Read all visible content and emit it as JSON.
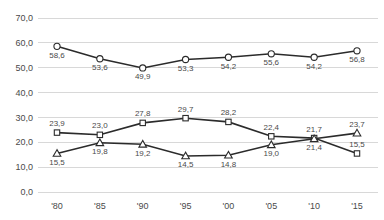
{
  "chart_data": {
    "type": "line",
    "title": "",
    "xlabel": "",
    "ylabel": "",
    "categories": [
      "'80",
      "'85",
      "'90",
      "'95",
      "'00",
      "'05",
      "'10",
      "'15"
    ],
    "ylim": [
      0,
      70
    ],
    "ytick_values": [
      0,
      10,
      20,
      30,
      40,
      50,
      60,
      70
    ],
    "ytick_labels": [
      "0,0",
      "10,0",
      "20,0",
      "30,0",
      "40,0",
      "50,0",
      "60,0",
      "70,0"
    ],
    "grid": true,
    "decimal_separator": ",",
    "legend_position": "top-cropped",
    "series": [
      {
        "name": "series-1",
        "marker": "circle",
        "values": [
          58.6,
          53.6,
          49.9,
          53.3,
          54.2,
          55.6,
          54.2,
          56.8
        ],
        "labels": [
          "58,6",
          "53,6",
          "49,9",
          "53,3",
          "54,2",
          "55,6",
          "54,2",
          "56,8"
        ],
        "label_positions": [
          "below",
          "below",
          "below",
          "below",
          "below",
          "below",
          "below",
          "below"
        ]
      },
      {
        "name": "series-2",
        "marker": "square",
        "values": [
          23.9,
          23.0,
          27.8,
          29.7,
          28.2,
          22.4,
          21.7,
          15.5
        ],
        "labels": [
          "23,9",
          "23,0",
          "27,8",
          "29,7",
          "28,2",
          "22,4",
          "21,7",
          "15,5"
        ],
        "label_positions": [
          "above",
          "above",
          "above",
          "above",
          "above",
          "above",
          "above",
          "above"
        ]
      },
      {
        "name": "series-3",
        "marker": "triangle",
        "values": [
          15.5,
          19.8,
          19.2,
          14.5,
          14.8,
          19.0,
          21.4,
          23.7
        ],
        "labels": [
          "15,5",
          "19,8",
          "19,2",
          "14,5",
          "14,8",
          "19,0",
          "21,4",
          "23,7"
        ],
        "label_positions": [
          "below",
          "below",
          "below",
          "below",
          "below",
          "below",
          "below",
          "above"
        ]
      }
    ],
    "colors": {
      "line": "#2b2b2b",
      "marker_fill": "#ffffff",
      "grid": "#d8d8d8",
      "text": "#4a4a4a",
      "background": "#ffffff"
    }
  }
}
